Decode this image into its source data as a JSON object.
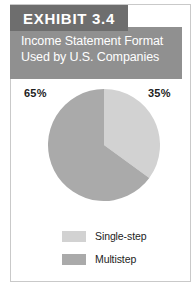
{
  "exhibit": {
    "banner_label": "EXHIBIT 3.4",
    "subtitle_line1": "Income Statement Format",
    "subtitle_line2": "Used by U.S. Companies"
  },
  "colors": {
    "banner_dark": "#6e6e6e",
    "banner_light": "#909090",
    "slice_single_step": "#d2d2d2",
    "slice_multistep": "#aaaaaa",
    "frame_border": "#c9c9c9",
    "text_dark": "#1d1d1d",
    "text_light": "#ffffff"
  },
  "chart_data": {
    "type": "pie",
    "title": "Income Statement Format Used by U.S. Companies",
    "categories": [
      "Single-step",
      "Multistep"
    ],
    "values": [
      35,
      65
    ],
    "value_labels": [
      "35%",
      "65%"
    ],
    "colors": [
      "#d2d2d2",
      "#aaaaaa"
    ],
    "start_angle_deg": 0,
    "direction": "clockwise",
    "legend_position": "bottom",
    "grid": false,
    "xlabel": "",
    "ylabel": ""
  },
  "labels": {
    "pct_left": "65%",
    "pct_right": "35%"
  },
  "legend": {
    "items": [
      {
        "label": "Single-step",
        "color": "#d2d2d2"
      },
      {
        "label": "Multistep",
        "color": "#aaaaaa"
      }
    ]
  }
}
